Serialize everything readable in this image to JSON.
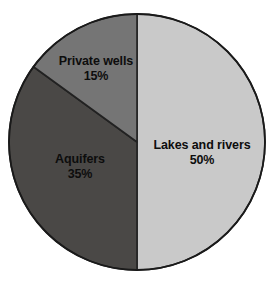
{
  "chart_data": {
    "type": "pie",
    "title": "",
    "subtitle": "",
    "xlabel": "",
    "ylabel": "",
    "legend_position": "none",
    "grid": false,
    "labels_on_slices": true,
    "units": "percent",
    "total": 100,
    "categories": [
      "Lakes and rivers",
      "Aquifers",
      "Private wells"
    ],
    "values": [
      50,
      35,
      15
    ],
    "slices": [
      {
        "label": "Lakes and rivers",
        "value": 50,
        "value_text": "50%",
        "color": "#c9c9c9",
        "start_angle_deg": 0,
        "end_angle_deg": 180
      },
      {
        "label": "Aquifers",
        "value": 35,
        "value_text": "35%",
        "color": "#4a4846",
        "start_angle_deg": 180,
        "end_angle_deg": 306
      },
      {
        "label": "Private wells",
        "value": 15,
        "value_text": "15%",
        "color": "#757575",
        "start_angle_deg": 306,
        "end_angle_deg": 360
      }
    ]
  },
  "figure": {
    "background_color": "#ffffff",
    "outline_color": "#222222",
    "text_color": "#0d0d0d",
    "center_x": 137,
    "center_y": 142,
    "radius": 128
  }
}
